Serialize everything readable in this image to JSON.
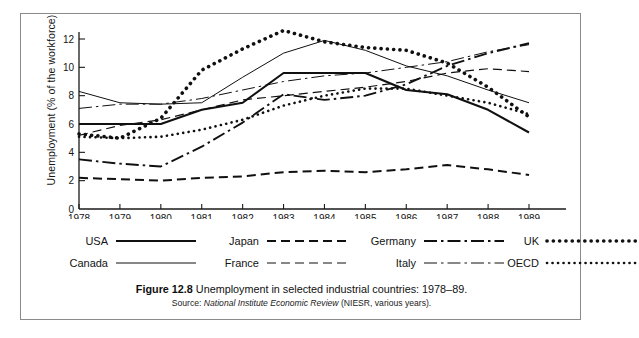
{
  "figure": {
    "caption_label": "Figure 12.8",
    "caption_text": "Unemployment in selected industrial countries: 1978–89.",
    "source_prefix": "Source:",
    "source_italic": "National Institute Economic Review",
    "source_suffix": "(NIESR, various years)."
  },
  "legend": {
    "items": [
      {
        "name": "USA",
        "style": "solid-thick",
        "row": 0,
        "col": 0
      },
      {
        "name": "Canada",
        "style": "solid-thin",
        "row": 1,
        "col": 0
      },
      {
        "name": "Japan",
        "style": "dashed-thick",
        "row": 0,
        "col": 1
      },
      {
        "name": "France",
        "style": "dashed-thin",
        "row": 1,
        "col": 1
      },
      {
        "name": "Germany",
        "style": "dashdot-thick",
        "row": 0,
        "col": 2
      },
      {
        "name": "Italy",
        "style": "dashdot-thin",
        "row": 1,
        "col": 2
      },
      {
        "name": "UK",
        "style": "dotted-thick",
        "row": 0,
        "col": 3
      },
      {
        "name": "OECD",
        "style": "dotted-thin",
        "row": 1,
        "col": 3
      }
    ]
  },
  "chart_data": {
    "type": "line",
    "title": "Unemployment in selected industrial countries: 1978–89",
    "xlabel": "",
    "ylabel": "Unemployment (% of the workforce)",
    "x": [
      1978,
      1979,
      1980,
      1981,
      1982,
      1983,
      1984,
      1985,
      1986,
      1987,
      1988,
      1989
    ],
    "xtick_labels": [
      "1978",
      "1979",
      "1980",
      "1981",
      "1982",
      "1983",
      "1984",
      "1985",
      "1986",
      "1987",
      "1988",
      "1989"
    ],
    "ytick_labels": [
      "0",
      "2",
      "4",
      "6",
      "8",
      "10",
      "12"
    ],
    "yticks": [
      0,
      2,
      4,
      6,
      8,
      10,
      12
    ],
    "xlim": [
      1978,
      1989
    ],
    "ylim": [
      0,
      13
    ],
    "grid": false,
    "legend_position": "below-plot",
    "series": [
      {
        "name": "USA",
        "style": "solid-thick",
        "values": [
          6.0,
          6.0,
          6.0,
          7.0,
          7.5,
          9.6,
          9.6,
          9.6,
          8.4,
          8.1,
          7.0,
          5.4
        ]
      },
      {
        "name": "Canada",
        "style": "solid-thin",
        "values": [
          8.3,
          7.5,
          7.4,
          7.5,
          9.3,
          11.0,
          11.9,
          11.2,
          10.1,
          9.4,
          8.4,
          7.5
        ]
      },
      {
        "name": "Japan",
        "style": "dashed-thick",
        "values": [
          2.2,
          2.1,
          2.0,
          2.2,
          2.3,
          2.6,
          2.7,
          2.6,
          2.8,
          3.1,
          2.8,
          2.4
        ]
      },
      {
        "name": "France",
        "style": "dashed-thin",
        "values": [
          5.2,
          5.9,
          6.3,
          7.0,
          7.7,
          8.0,
          8.3,
          8.6,
          9.0,
          9.6,
          9.9,
          9.7
        ]
      },
      {
        "name": "Germany",
        "style": "dashdot-thick",
        "values": [
          3.5,
          3.2,
          3.0,
          4.4,
          6.1,
          8.1,
          7.7,
          8.0,
          8.8,
          10.1,
          11.0,
          11.7
        ]
      },
      {
        "name": "Italy",
        "style": "dashdot-thin",
        "values": [
          7.1,
          7.4,
          7.4,
          7.8,
          8.4,
          9.0,
          9.4,
          9.6,
          10.0,
          10.4,
          11.1,
          11.6
        ]
      },
      {
        "name": "UK",
        "style": "dotted-thick",
        "values": [
          5.3,
          5.0,
          6.4,
          9.8,
          11.3,
          12.6,
          11.8,
          11.4,
          11.2,
          10.3,
          8.6,
          6.5
        ]
      },
      {
        "name": "OECD",
        "style": "dotted-thin",
        "values": [
          5.1,
          5.0,
          5.1,
          5.6,
          6.3,
          7.3,
          8.0,
          8.5,
          8.5,
          8.0,
          7.5,
          6.7
        ]
      }
    ]
  }
}
